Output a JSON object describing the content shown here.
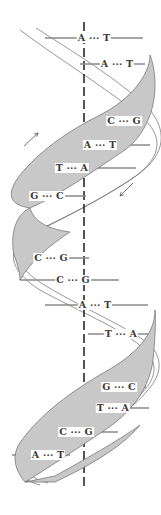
{
  "diagram": {
    "colors": {
      "ribbon_fill": "#c8c8c8",
      "ribbon_edge": "#6a6a6a",
      "axis": "#2a2a2a",
      "rung": "#8a8a8a",
      "text": "#3a3a3a",
      "background": "#ffffff"
    },
    "axis": {
      "x": 84,
      "y_top": 22,
      "y_bottom": 490,
      "style": "dashed"
    },
    "base_pairs": [
      {
        "left": "A",
        "right": "T",
        "label": "A ··· T",
        "y": 38,
        "cx": 94,
        "x1": 45,
        "x2": 143
      },
      {
        "left": "A",
        "right": "T",
        "label": "A ··· T",
        "y": 64,
        "cx": 117,
        "x1": 80,
        "x2": 145
      },
      {
        "left": "C",
        "right": "G",
        "label": "C ··· G",
        "y": 121,
        "cx": 124,
        "x1": 104,
        "x2": 147
      },
      {
        "left": "A",
        "right": "T",
        "label": "A ··· T",
        "y": 145,
        "cx": 100,
        "x1": 64,
        "x2": 150
      },
      {
        "left": "T",
        "right": "A",
        "label": "T ··· A",
        "y": 168,
        "cx": 72,
        "x1": 30,
        "x2": 136
      },
      {
        "left": "G",
        "right": "C",
        "label": "G ··· C",
        "y": 196,
        "cx": 47,
        "x1": 20,
        "x2": 86
      },
      {
        "left": "C",
        "right": "G",
        "label": "C ··· G",
        "y": 258,
        "cx": 51,
        "x1": 20,
        "x2": 89
      },
      {
        "left": "C",
        "right": "G",
        "label": "C ··· G",
        "y": 280,
        "cx": 73,
        "x1": 20,
        "x2": 119
      },
      {
        "left": "A",
        "right": "T",
        "label": "A ··· T",
        "y": 305,
        "cx": 95,
        "x1": 45,
        "x2": 148
      },
      {
        "left": "T",
        "right": "A",
        "label": "T ··· A",
        "y": 334,
        "cx": 121,
        "x1": 88,
        "x2": 148
      },
      {
        "left": "G",
        "right": "C",
        "label": "G ··· C",
        "y": 387,
        "cx": 119,
        "x1": 104,
        "x2": 146
      },
      {
        "left": "T",
        "right": "A",
        "label": "T ··· A",
        "y": 408,
        "cx": 113,
        "x1": 70,
        "x2": 149
      },
      {
        "left": "C",
        "right": "G",
        "label": "C ··· G",
        "y": 432,
        "cx": 76,
        "x1": 35,
        "x2": 118
      },
      {
        "left": "A",
        "right": "T",
        "label": "A ··· T",
        "y": 455,
        "cx": 48,
        "x1": 12,
        "x2": 70
      }
    ],
    "direction_arrows": [
      {
        "name": "strand-direction-up",
        "x1": 24,
        "y1": 146,
        "x2": 38,
        "y2": 133
      },
      {
        "name": "strand-direction-down",
        "x1": 133,
        "y1": 183,
        "x2": 120,
        "y2": 196
      }
    ]
  }
}
